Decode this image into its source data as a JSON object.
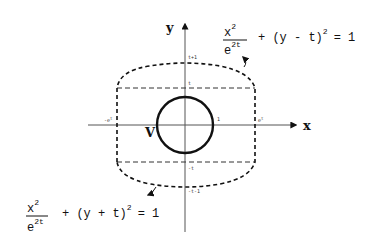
{
  "axes": {
    "x_label": "x",
    "y_label": "y"
  },
  "ticks": {
    "t_plus_1": "t+1",
    "t": "t",
    "one": "1",
    "minus_t": "-t",
    "minus_t_minus_1": "-t-1",
    "e_t": "e^t",
    "e_t_base": "e",
    "e_t_exp": "t",
    "minus_e_t_base": "-e",
    "minus_e_t_exp": "t"
  },
  "region_label": "V",
  "equation_top": {
    "numerator_base": "x",
    "numerator_exp": "2",
    "denominator_base": "e",
    "denominator_exp": "2t",
    "rest": "+ (y - t)",
    "rest_exp": "2",
    "equals": "= 1"
  },
  "equation_bottom": {
    "numerator_base": "x",
    "numerator_exp": "2",
    "denominator_base": "e",
    "denominator_exp": "2t",
    "rest": "+ (y + t)",
    "rest_exp": "2",
    "equals": "= 1"
  },
  "colors": {
    "stroke": "#111111",
    "axis": "#555555",
    "background": "#ffffff"
  }
}
